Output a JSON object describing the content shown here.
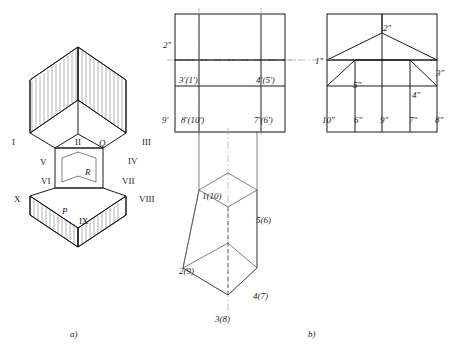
{
  "figure": {
    "corner_note": "",
    "captions": [
      {
        "text": "a)",
        "x": 70,
        "y": 334
      },
      {
        "text": "b)",
        "x": 308,
        "y": 334
      }
    ]
  },
  "pictorial": {
    "name": "hexagonal-prism-pictorial",
    "labels": [
      {
        "text": "I",
        "x": 12,
        "y": 143
      },
      {
        "text": "II",
        "x": 75,
        "y": 143
      },
      {
        "text": "III",
        "x": 142,
        "y": 143
      },
      {
        "text": "Q",
        "x": 99,
        "y": 144,
        "italic": true
      },
      {
        "text": "IV",
        "x": 128,
        "y": 162
      },
      {
        "text": "V",
        "x": 40,
        "y": 163
      },
      {
        "text": "VI",
        "x": 41,
        "y": 182
      },
      {
        "text": "VII",
        "x": 124,
        "y": 182
      },
      {
        "text": "R",
        "x": 85,
        "y": 173,
        "italic": true
      },
      {
        "text": "X",
        "x": 14,
        "y": 200
      },
      {
        "text": "VIII",
        "x": 141,
        "y": 200
      },
      {
        "text": "IX",
        "x": 79,
        "y": 222
      },
      {
        "text": "P",
        "x": 62,
        "y": 212,
        "italic": true
      }
    ]
  },
  "orthographic": {
    "name": "three-view-projection",
    "labels": [
      {
        "text": "2\"",
        "x": 164,
        "y": 46
      },
      {
        "text": "3'(1')",
        "x": 181,
        "y": 81
      },
      {
        "text": "4'(5')",
        "x": 258,
        "y": 81
      },
      {
        "text": "1\"",
        "x": 317,
        "y": 62
      },
      {
        "text": "2\"",
        "x": 385,
        "y": 29
      },
      {
        "text": "3\"",
        "x": 438,
        "y": 74
      },
      {
        "text": "5\"",
        "x": 355,
        "y": 86
      },
      {
        "text": "4\"",
        "x": 414,
        "y": 96
      },
      {
        "text": "9'",
        "x": 164,
        "y": 121
      },
      {
        "text": "8'(10')",
        "x": 183,
        "y": 121
      },
      {
        "text": "7'(6')",
        "x": 256,
        "y": 121
      },
      {
        "text": "10\"",
        "x": 324,
        "y": 121
      },
      {
        "text": "6\"",
        "x": 356,
        "y": 121
      },
      {
        "text": "9\"",
        "x": 382,
        "y": 121
      },
      {
        "text": "7\"",
        "x": 411,
        "y": 121
      },
      {
        "text": "8\"",
        "x": 437,
        "y": 121
      },
      {
        "text": "1(10)",
        "x": 204,
        "y": 197
      },
      {
        "text": "5(6)",
        "x": 258,
        "y": 221
      },
      {
        "text": "2(9)",
        "x": 181,
        "y": 272
      },
      {
        "text": "4(7)",
        "x": 255,
        "y": 297
      },
      {
        "text": "3(8)",
        "x": 217,
        "y": 320
      }
    ]
  }
}
